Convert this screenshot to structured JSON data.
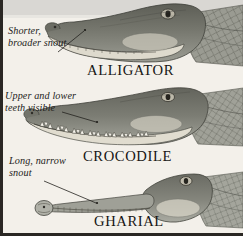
{
  "figure": {
    "kind": "comparative-anatomy-illustration",
    "background_color": "#f3f0ea",
    "top_band_color": "#d8d6d2",
    "border_color": "#2a2724",
    "ink_color": "#1d1c1a"
  },
  "specimens": [
    {
      "id": "alligator",
      "caption": "ALLIGATOR",
      "annotation_lines": [
        "Shorter,",
        "broader snout"
      ],
      "snout_description": "short broad rounded snout, lower teeth hidden",
      "body_color": "#6f7068",
      "belly_color": "#d7d3c7",
      "scale_color": "#8d8e86"
    },
    {
      "id": "crocodile",
      "caption": "CROCODILE",
      "annotation_lines": [
        "Upper and lower",
        "teeth visible"
      ],
      "snout_description": "tapered snout with interlocking exposed teeth",
      "body_color": "#74756c",
      "belly_color": "#dbd7cb",
      "scale_color": "#91928a"
    },
    {
      "id": "gharial",
      "caption": "GHARIAL",
      "annotation_lines": [
        "Long, narrow",
        "snout"
      ],
      "snout_description": "very long slender tubular snout with bulbous tip",
      "body_color": "#7a7b72",
      "belly_color": "#dedacd",
      "scale_color": "#95968e"
    }
  ]
}
